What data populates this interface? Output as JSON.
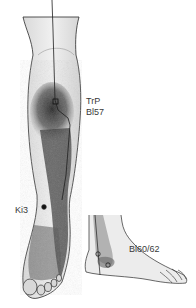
{
  "figure": {
    "labels": {
      "trp": "TrP",
      "bl57": "Bl57",
      "ki3": "Ki3",
      "bl60_62": "Bl60/62"
    },
    "colors": {
      "skin": "#e6e6e6",
      "outline": "#2a2a2a",
      "shading": "#3c3c3c",
      "meridian_line": "#1e1e1e",
      "text": "#3a3a3a"
    }
  }
}
